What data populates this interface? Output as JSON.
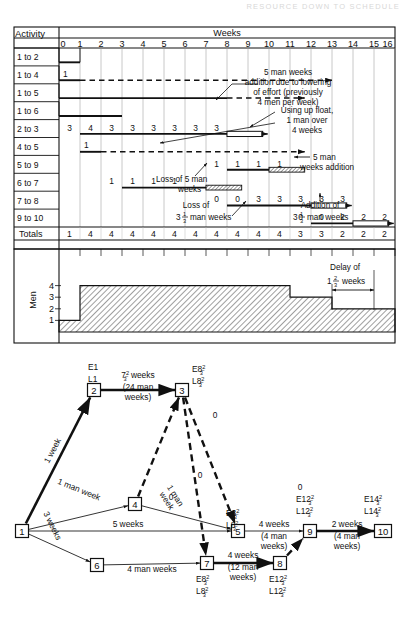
{
  "page": {
    "running_header": "RESOURCE DOWN TO SCHEDULE",
    "figure_kind": "gantt-chart-with-resource-histogram-and-network-diagram"
  },
  "gantt": {
    "corner_label": "Activity",
    "scale_title": "Weeks",
    "week_ticks": [
      "0",
      "1",
      "2",
      "3",
      "4",
      "5",
      "6",
      "7",
      "8",
      "9",
      "10",
      "11",
      "12",
      "13",
      "14",
      "15",
      "16"
    ],
    "week_min": 0,
    "week_max": 16,
    "rows": [
      {
        "name": "1 to 2",
        "bars": [
          {
            "start": 0,
            "end": 1,
            "style": "solid",
            "label": ""
          }
        ]
      },
      {
        "name": "1 to 4",
        "bars": [
          {
            "start": 0,
            "end": 1,
            "style": "solid",
            "label": "1"
          },
          {
            "start": 1,
            "end": 13,
            "style": "dashed",
            "label": ""
          }
        ]
      },
      {
        "name": "1 to 5",
        "bars": [
          {
            "start": 0,
            "end": 8,
            "style": "solid",
            "label": ""
          },
          {
            "start": 8,
            "end": 11.7,
            "style": "dashed",
            "label": ""
          }
        ]
      },
      {
        "name": "1 to 6",
        "bars": [
          {
            "start": 0,
            "end": 3,
            "style": "solid",
            "label": ""
          }
        ]
      },
      {
        "name": "2 to 3",
        "bars": [
          {
            "start": 1,
            "end": 8,
            "style": "solid",
            "label": ""
          },
          {
            "start": 8,
            "end": 9.7,
            "style": "hollow",
            "label": ""
          }
        ],
        "cells": [
          {
            "week": 1,
            "value": "3"
          },
          {
            "week": 2,
            "value": "4"
          },
          {
            "week": 3,
            "value": "3"
          },
          {
            "week": 4,
            "value": "3"
          },
          {
            "week": 5,
            "value": "3"
          },
          {
            "week": 6,
            "value": "3"
          },
          {
            "week": 7,
            "value": "3"
          },
          {
            "week": 8,
            "value": "3"
          }
        ]
      },
      {
        "name": "4 to 5",
        "bars": [
          {
            "start": 1,
            "end": 2,
            "style": "solid",
            "label": "1"
          },
          {
            "start": 2,
            "end": 11.7,
            "style": "dashed",
            "label": ""
          }
        ]
      },
      {
        "name": "5 to 9",
        "bars": [
          {
            "start": 8,
            "end": 10,
            "style": "solid",
            "label": ""
          },
          {
            "start": 10,
            "end": 11.7,
            "style": "hatched",
            "label": ""
          }
        ],
        "cells": [
          {
            "week": 8,
            "value": "1"
          },
          {
            "week": 9,
            "value": "1"
          },
          {
            "week": 10,
            "value": "1"
          },
          {
            "week": 11,
            "value": "1"
          }
        ]
      },
      {
        "name": "6 to 7",
        "bars": [
          {
            "start": 3,
            "end": 7,
            "style": "solid",
            "label": ""
          },
          {
            "start": 7,
            "end": 8.7,
            "style": "hatched",
            "label": ""
          }
        ],
        "cells": [
          {
            "week": 3,
            "value": "1"
          },
          {
            "week": 4,
            "value": "1"
          },
          {
            "week": 5,
            "value": "1"
          },
          {
            "week": 6,
            "value": "1"
          }
        ]
      },
      {
        "name": "7 to 8",
        "bars": [
          {
            "start": 8,
            "end": 12,
            "style": "solid",
            "label": ""
          },
          {
            "start": 12,
            "end": 13.7,
            "style": "hollow",
            "label": ""
          }
        ],
        "cells": [
          {
            "week": 8,
            "value": "0"
          },
          {
            "week": 9,
            "value": "0"
          },
          {
            "week": 10,
            "value": "3"
          },
          {
            "week": 11,
            "value": "3"
          },
          {
            "week": 12,
            "value": "3"
          },
          {
            "week": 13,
            "value": "3"
          },
          {
            "week": 14,
            "value": "3"
          }
        ]
      },
      {
        "name": "9 to 10",
        "bars": [
          {
            "start": 12,
            "end": 14,
            "style": "solid",
            "label": ""
          },
          {
            "start": 14,
            "end": 15.7,
            "style": "hollow",
            "label": ""
          }
        ],
        "cells": [
          {
            "week": 12,
            "value": "0"
          },
          {
            "week": 13,
            "value": "0"
          },
          {
            "week": 14,
            "value": "2"
          },
          {
            "week": 15,
            "value": "2"
          },
          {
            "week": 16,
            "value": "2"
          }
        ]
      }
    ],
    "totals_label": "Totals",
    "totals": [
      "1",
      "4",
      "4",
      "4",
      "4",
      "4",
      "4",
      "4",
      "4",
      "4",
      "4",
      "3",
      "3",
      "2",
      "2",
      "2"
    ],
    "annotations": [
      {
        "id": "ann-5-man-weeks-addition-lowering",
        "lines": [
          "5 man weeks",
          "addition due to lowering",
          "of effort (previously",
          "4 men per week)"
        ]
      },
      {
        "id": "ann-using-up-float",
        "lines": [
          "Using up float,",
          "1 man over",
          "4 weeks"
        ]
      },
      {
        "id": "ann-5-man-weeks-addition",
        "lines": [
          "5 man",
          "weeks addition"
        ]
      },
      {
        "id": "ann-loss-of-5-man-weeks",
        "lines": [
          "Loss of 5 man",
          "weeks"
        ]
      },
      {
        "id": "ann-loss-of-3-1-3",
        "lines": [
          "Loss of",
          "3",
          "1",
          "3",
          "man weeks"
        ],
        "text_a": "Loss of",
        "frac_whole": "3",
        "frac_num": "1",
        "frac_den": "3",
        "tail": "man weeks"
      },
      {
        "id": "ann-addition-of-3-1-3",
        "lines": [
          "Addition of"
        ],
        "frac_whole": "3",
        "frac_num": "1",
        "frac_den": "3",
        "tail": "man weeks"
      },
      {
        "id": "ann-delay-of",
        "line1": "Delay of",
        "frac_whole": "1",
        "frac_num": "2",
        "frac_den": "3",
        "tail": "weeks"
      }
    ]
  },
  "histogram": {
    "y_axis_label": "Men",
    "y_ticks": [
      "1",
      "2",
      "3",
      "4"
    ],
    "steps": [
      {
        "from": 0,
        "to": 1,
        "men": 1
      },
      {
        "from": 1,
        "to": 11,
        "men": 4
      },
      {
        "from": 11,
        "to": 13,
        "men": 3
      },
      {
        "from": 13,
        "to": 16,
        "men": 2
      }
    ],
    "delay_marker": {
      "line1": "Delay of",
      "whole": "1",
      "num": "2",
      "den": "3",
      "unit": "weeks",
      "from": 14,
      "to": 16
    }
  },
  "network": {
    "nodes": [
      {
        "id": "1",
        "label": "1",
        "x": 22,
        "y": 531,
        "early": "",
        "late": "",
        "e_num": "",
        "e_den": "",
        "l_num": "",
        "l_den": ""
      },
      {
        "id": "2",
        "label": "2",
        "x": 94,
        "y": 390,
        "early": "E1",
        "late": "L1"
      },
      {
        "id": "3",
        "label": "3",
        "x": 182,
        "y": 390,
        "early": "E8",
        "late": "L8",
        "e_num": "2",
        "e_den": "3",
        "l_num": "2",
        "l_den": "3"
      },
      {
        "id": "4",
        "label": "4",
        "x": 135,
        "y": 504,
        "early": "",
        "late": ""
      },
      {
        "id": "5",
        "label": "5",
        "x": 238,
        "y": 531,
        "early": "E8",
        "late": "L8",
        "e_num": "2",
        "e_den": "3",
        "l_num": "2",
        "l_den": "3"
      },
      {
        "id": "6",
        "label": "6",
        "x": 97,
        "y": 565,
        "early": "",
        "late": ""
      },
      {
        "id": "7",
        "label": "7",
        "x": 207,
        "y": 563,
        "early": "E8",
        "late": "L8",
        "e_num": "2",
        "e_den": "3",
        "l_num": "2",
        "l_den": "3"
      },
      {
        "id": "8",
        "label": "8",
        "x": 280,
        "y": 563,
        "early": "E12",
        "late": "L12",
        "e_num": "2",
        "e_den": "3",
        "l_num": "2",
        "l_den": "3"
      },
      {
        "id": "9",
        "label": "9",
        "x": 310,
        "y": 531,
        "early": "E12",
        "late": "L12",
        "e_num": "2",
        "e_den": "3",
        "l_num": "2",
        "l_den": "3"
      },
      {
        "id": "10",
        "label": "10",
        "x": 383,
        "y": 531,
        "early": "E14",
        "late": "L14",
        "e_num": "2",
        "e_den": "3",
        "l_num": "2",
        "l_den": "3"
      }
    ],
    "edges": [
      {
        "from": "1",
        "to": "2",
        "style": "critical",
        "label": "1 week"
      },
      {
        "from": "2",
        "to": "3",
        "style": "critical",
        "label_main": "weeks",
        "label_whole": "7",
        "label_num": "2",
        "label_den": "3",
        "label_sub1": "(24 man",
        "label_sub2": "weeks)"
      },
      {
        "from": "1",
        "to": "5",
        "style": "normal",
        "label": "5 weeks"
      },
      {
        "from": "1",
        "to": "4",
        "style": "normal",
        "label": "1 man week"
      },
      {
        "from": "1",
        "to": "6",
        "style": "normal",
        "label": "3 weeks"
      },
      {
        "from": "4",
        "to": "5",
        "style": "normal",
        "label": "1 man week"
      },
      {
        "from": "6",
        "to": "7",
        "style": "normal",
        "label": "4 man weeks"
      },
      {
        "from": "7",
        "to": "8",
        "style": "critical",
        "label": "4 weeks",
        "label_sub1": "(12 man",
        "label_sub2": "weeks)"
      },
      {
        "from": "5",
        "to": "9",
        "style": "normal",
        "label": "4 weeks",
        "label_sub1": "(4 man",
        "label_sub2": "weeks)"
      },
      {
        "from": "9",
        "to": "10",
        "style": "critical",
        "label": "2 weeks",
        "label_sub1": "(4 man",
        "label_sub2": "weeks)"
      },
      {
        "from": "3",
        "to": "5",
        "style": "dummy",
        "label": "0"
      },
      {
        "from": "3",
        "to": "7",
        "style": "dummy",
        "label": "0"
      },
      {
        "from": "4",
        "to": "3",
        "style": "dummy",
        "label": "0"
      },
      {
        "from": "8",
        "to": "9",
        "style": "dummy",
        "label": "0"
      }
    ],
    "dummy_labels": [
      "0",
      "0",
      "0",
      "0"
    ]
  }
}
